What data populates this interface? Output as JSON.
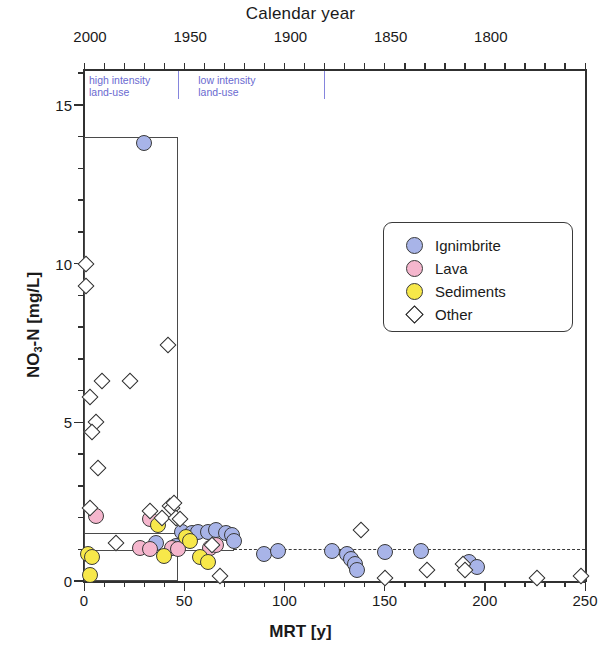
{
  "figure": {
    "top_axis_title": "Calendar year",
    "x_axis_label": "MRT [y]",
    "y_axis_label_pre": "NO",
    "y_axis_label_sub": "3",
    "y_axis_label_post": "-N [mg/L]"
  },
  "annotations": {
    "high_intensity": "high intensity\nland-use",
    "low_intensity": "low intensity\nland-use",
    "annotation_color": "#6a6ad0"
  },
  "legend": {
    "items": [
      {
        "label": "Ignimbrite",
        "symbol": "filled-circle",
        "color": "#a8b4e8"
      },
      {
        "label": "Lava",
        "symbol": "filled-circle",
        "color": "#f5b6cd"
      },
      {
        "label": "Sediments",
        "symbol": "filled-circle",
        "color": "#f7e84a"
      },
      {
        "label": "Other",
        "symbol": "open-diamond",
        "color": "#ffffff"
      }
    ]
  },
  "chart_data": {
    "type": "scatter",
    "title": "",
    "xlabel": "MRT [y]",
    "ylabel": "NO3-N [mg/L]",
    "top_axis_label": "Calendar year",
    "xlim": [
      0,
      250
    ],
    "ylim": [
      0,
      16.1
    ],
    "x_ticks": [
      0,
      50,
      100,
      150,
      200,
      250
    ],
    "x_minor_tick_step": 10,
    "y_ticks": [
      0,
      5,
      10,
      15
    ],
    "y_minor_tick_step": 1,
    "top_ticks": [
      {
        "label": "2000",
        "mrt": 3
      },
      {
        "label": "1950",
        "mrt": 53
      },
      {
        "label": "1900",
        "mrt": 103
      },
      {
        "label": "1850",
        "mrt": 153
      },
      {
        "label": "1800",
        "mrt": 203
      }
    ],
    "grid": false,
    "legend_position": "upper right",
    "annotations": [
      {
        "text": "high intensity land-use",
        "mrt_from": 0,
        "mrt_to": 47
      },
      {
        "text": "low intensity land-use",
        "mrt_from": 53,
        "mrt_to": 120
      }
    ],
    "reference_lines": [
      {
        "kind": "dashed-horizontal",
        "y": 1.0,
        "x_from": 75,
        "x_to": 250
      }
    ],
    "boxes": [
      {
        "name": "high-intensity-box",
        "x_from": 0,
        "x_to": 47,
        "y_from": 0,
        "y_to": 14.0
      },
      {
        "name": "low-nitrate-box",
        "x_from": 0,
        "x_to": 75,
        "y_from": 0.95,
        "y_to": 1.52
      }
    ],
    "series": [
      {
        "name": "Ignimbrite",
        "color": "#a8b4e8",
        "marker": "circle",
        "points": [
          [
            30,
            13.8
          ],
          [
            36,
            1.2
          ],
          [
            46,
            1.1
          ],
          [
            49,
            1.55
          ],
          [
            54,
            1.5
          ],
          [
            57,
            1.55
          ],
          [
            62,
            1.55
          ],
          [
            66,
            1.6
          ],
          [
            71,
            1.5
          ],
          [
            74,
            1.45
          ],
          [
            75,
            1.25
          ],
          [
            90,
            0.85
          ],
          [
            97,
            0.95
          ],
          [
            124,
            0.95
          ],
          [
            131,
            0.85
          ],
          [
            133,
            0.7
          ],
          [
            135,
            0.55
          ],
          [
            136,
            0.35
          ],
          [
            150,
            0.9
          ],
          [
            168,
            0.95
          ],
          [
            192,
            0.6
          ],
          [
            196,
            0.45
          ]
        ]
      },
      {
        "name": "Lava",
        "color": "#f5b6cd",
        "marker": "circle",
        "points": [
          [
            6,
            2.05
          ],
          [
            33,
            1.95
          ],
          [
            28,
            1.05
          ],
          [
            33,
            1.0
          ],
          [
            44,
            1.05
          ],
          [
            47,
            1.0
          ],
          [
            63,
            1.05
          ],
          [
            66,
            1.15
          ]
        ]
      },
      {
        "name": "Sediments",
        "color": "#f7e84a",
        "marker": "circle",
        "points": [
          [
            2,
            0.85
          ],
          [
            4,
            0.75
          ],
          [
            3,
            0.2
          ],
          [
            37,
            1.75
          ],
          [
            40,
            0.8
          ],
          [
            51,
            1.4
          ],
          [
            53,
            1.25
          ],
          [
            58,
            0.75
          ],
          [
            62,
            0.6
          ]
        ]
      },
      {
        "name": "Other",
        "color": "#ffffff",
        "marker": "diamond",
        "points": [
          [
            1,
            10.0
          ],
          [
            1,
            9.3
          ],
          [
            3,
            5.8
          ],
          [
            9,
            6.3
          ],
          [
            6,
            5.0
          ],
          [
            4,
            4.7
          ],
          [
            7,
            3.55
          ],
          [
            3,
            2.3
          ],
          [
            23,
            6.3
          ],
          [
            42,
            7.45
          ],
          [
            33,
            2.2
          ],
          [
            39,
            2.0
          ],
          [
            43,
            2.35
          ],
          [
            44,
            2.3
          ],
          [
            45,
            2.45
          ],
          [
            46,
            2.0
          ],
          [
            48,
            1.95
          ],
          [
            16,
            1.2
          ],
          [
            64,
            1.15
          ],
          [
            68,
            0.15
          ],
          [
            138,
            1.6
          ],
          [
            150,
            0.1
          ],
          [
            171,
            0.35
          ],
          [
            189,
            0.55
          ],
          [
            190,
            0.35
          ],
          [
            226,
            0.1
          ],
          [
            248,
            0.15
          ]
        ]
      }
    ]
  }
}
